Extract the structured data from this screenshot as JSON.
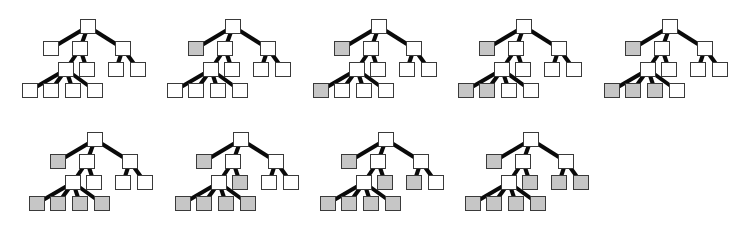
{
  "figure": {
    "colors": {
      "edge": "#0a0a0a",
      "node_border": "#3a3a3a",
      "node_empty": "#ffffff",
      "node_filled": "#c6c6c6"
    },
    "tree_template": {
      "nodes": [
        {
          "id": "root",
          "x": 0,
          "y": 0
        },
        {
          "id": "L",
          "x": -37,
          "y": 22
        },
        {
          "id": "M",
          "x": -8,
          "y": 22
        },
        {
          "id": "R",
          "x": 35,
          "y": 22
        },
        {
          "id": "S",
          "x": -22,
          "y": 43
        },
        {
          "id": "ML",
          "x": -1,
          "y": 43
        },
        {
          "id": "RL1",
          "x": 28,
          "y": 43
        },
        {
          "id": "RL2",
          "x": 50,
          "y": 43
        },
        {
          "id": "B1",
          "x": -58,
          "y": 64
        },
        {
          "id": "B2",
          "x": -37,
          "y": 64
        },
        {
          "id": "B3",
          "x": -15,
          "y": 64
        },
        {
          "id": "B4",
          "x": 7,
          "y": 64
        }
      ],
      "edges": [
        [
          "root",
          "L"
        ],
        [
          "root",
          "M"
        ],
        [
          "root",
          "R"
        ],
        [
          "M",
          "S"
        ],
        [
          "M",
          "ML"
        ],
        [
          "R",
          "RL1"
        ],
        [
          "R",
          "RL2"
        ],
        [
          "S",
          "B1"
        ],
        [
          "S",
          "B2"
        ],
        [
          "S",
          "B3"
        ],
        [
          "S",
          "B4"
        ]
      ]
    },
    "trees": [
      {
        "step": 1,
        "root_x": 80,
        "root_y": 19,
        "filled": []
      },
      {
        "step": 2,
        "root_x": 225,
        "root_y": 19,
        "filled": [
          "L"
        ]
      },
      {
        "step": 3,
        "root_x": 371,
        "root_y": 19,
        "filled": [
          "L",
          "B1"
        ]
      },
      {
        "step": 4,
        "root_x": 516,
        "root_y": 19,
        "filled": [
          "L",
          "B1",
          "B2"
        ]
      },
      {
        "step": 5,
        "root_x": 662,
        "root_y": 19,
        "filled": [
          "L",
          "B1",
          "B2",
          "B3"
        ]
      },
      {
        "step": 6,
        "root_x": 87,
        "root_y": 132,
        "filled": [
          "L",
          "B1",
          "B2",
          "B3",
          "B4"
        ]
      },
      {
        "step": 7,
        "root_x": 233,
        "root_y": 132,
        "filled": [
          "L",
          "B1",
          "B2",
          "B3",
          "B4",
          "ML"
        ]
      },
      {
        "step": 8,
        "root_x": 378,
        "root_y": 132,
        "filled": [
          "L",
          "B1",
          "B2",
          "B3",
          "B4",
          "ML",
          "RL1"
        ]
      },
      {
        "step": 9,
        "root_x": 523,
        "root_y": 132,
        "filled": [
          "L",
          "B1",
          "B2",
          "B3",
          "B4",
          "ML",
          "RL1",
          "RL2"
        ]
      }
    ]
  }
}
